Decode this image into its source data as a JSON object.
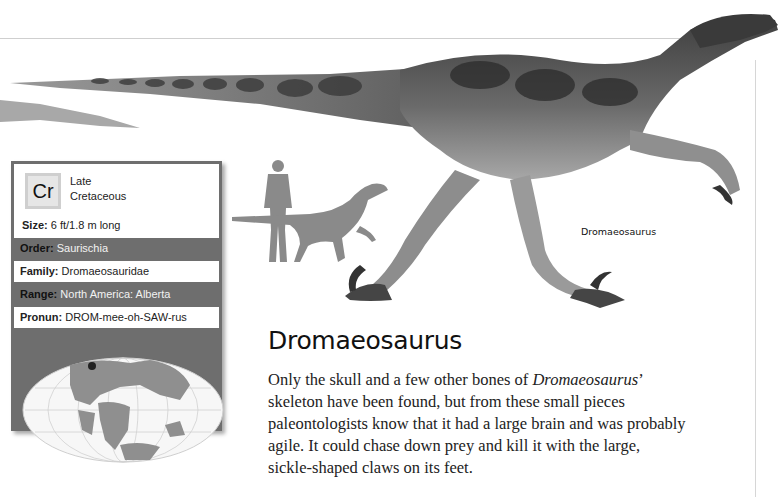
{
  "illustration": {
    "subject": "Dromaeosaurus",
    "caption": "Dromaeosaurus",
    "scale_figures": [
      "human-silhouette",
      "dinosaur-silhouette"
    ]
  },
  "fact_box": {
    "era_badge": "Cr",
    "era_line1": "Late",
    "era_line2": "Cretaceous",
    "size_label": "Size:",
    "size_value": "6 ft/1.8 m long",
    "order_label": "Order:",
    "order_value": "Saurischia",
    "family_label": "Family:",
    "family_value": "Dromaeosauridae",
    "range_label": "Range:",
    "range_value": "North America: Alberta",
    "pronun_label": "Pronun:",
    "pronun_value": "DROM-mee-oh-SAW-rus",
    "map_marker": "Alberta, North America"
  },
  "article": {
    "title": "Dromaeosaurus",
    "body_pre": "Only the skull and a few other bones of ",
    "body_italic": "Dromaeosaurus",
    "body_post": "’ skeleton have been found, but from these small pieces paleontologists know that it had a large brain and was probably agile. It could chase down prey and kill it with the large, sickle-shaped claws on its feet."
  },
  "colors": {
    "box_dark": "#6e6e6e",
    "box_light": "#ffffff",
    "silhouette": "#8a8a8a",
    "rule": "#cfcfcf"
  }
}
